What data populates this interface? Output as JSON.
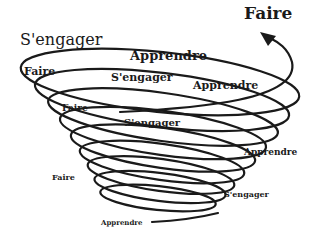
{
  "diagram": {
    "type": "spiral",
    "stroke_color": "#1a1a1a",
    "background": "#ffffff",
    "arrow_label": "Faire",
    "labels": [
      {
        "id": "sengager_1",
        "text": "S'engager"
      },
      {
        "id": "apprendre_1",
        "text": "Apprendre"
      },
      {
        "id": "faire_1",
        "text": "Faire"
      },
      {
        "id": "sengager_2",
        "text": "S'engager"
      },
      {
        "id": "apprendre_2",
        "text": "Apprendre"
      },
      {
        "id": "faire_2",
        "text": "Faire"
      },
      {
        "id": "sengager_3",
        "text": "S'engager"
      },
      {
        "id": "apprendre_3",
        "text": "Apprendre"
      },
      {
        "id": "faire_3",
        "text": "Faire"
      },
      {
        "id": "sengager_4",
        "text": "S'engager"
      },
      {
        "id": "apprendre_4",
        "text": "Apprendre"
      }
    ]
  }
}
